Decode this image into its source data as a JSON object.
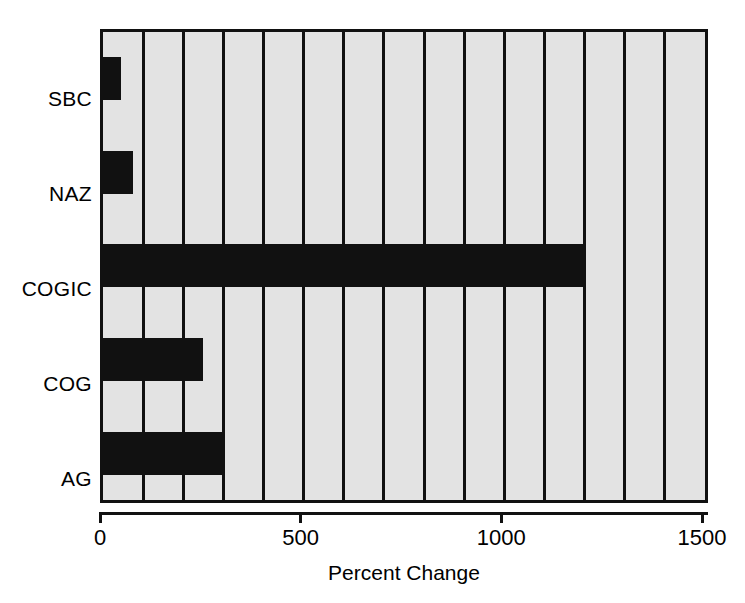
{
  "chart_data": {
    "type": "bar",
    "orientation": "horizontal",
    "title": "",
    "xlabel": "Percent Change",
    "ylabel": "",
    "categories": [
      "AG",
      "COG",
      "COGIC",
      "NAZ",
      "SBC"
    ],
    "values": [
      300,
      250,
      1200,
      75,
      45
    ],
    "series": [
      {
        "name": "Percent Change",
        "values": [
          300,
          250,
          1200,
          75,
          45
        ]
      }
    ],
    "xlim": [
      0,
      1500
    ],
    "xticks": [
      0,
      500,
      1000,
      1500
    ],
    "xtick_labels": [
      "0",
      "500",
      "1000",
      "1500"
    ],
    "gridlines": [
      100,
      200,
      300,
      400,
      500,
      600,
      700,
      800,
      900,
      1000,
      1100,
      1200,
      1300,
      1400
    ],
    "grid": true,
    "legend": "none",
    "bar_color": "#111111",
    "plot_background": "#e3e3e3",
    "axis_color": "#111111",
    "page_background": "#ffffff",
    "display_order_top_to_bottom": [
      "SBC",
      "NAZ",
      "COGIC",
      "COG",
      "AG"
    ]
  },
  "axis": {
    "x_title": "Percent Change",
    "tick_labels": [
      "0",
      "500",
      "1000",
      "1500"
    ],
    "category_labels_top_to_bottom": [
      "SBC",
      "NAZ",
      "COGIC",
      "COG",
      "AG"
    ]
  }
}
